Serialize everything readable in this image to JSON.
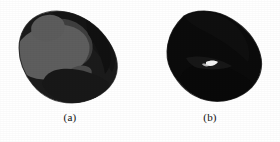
{
  "figure": {
    "background_color": "#ffffff",
    "panels": [
      {
        "id": "a",
        "caption": "(a)",
        "description": "segmented blob render with distinct gray shaded regions",
        "colors": {
          "body_dark": "#1b1b1b",
          "mid_gray": "#3e3e3e",
          "light_gray": "#5e5e5e",
          "highlight_gray": "#4a4a4a",
          "outline": "#151515"
        },
        "regions": [
          {
            "name": "large-light-ellipse",
            "color": "#5e5e5e"
          },
          {
            "name": "upper-mid-lobe",
            "color": "#3e3e3e"
          },
          {
            "name": "lower-small-lobe",
            "color": "#4a4a4a"
          },
          {
            "name": "dark-body",
            "color": "#1b1b1b"
          },
          {
            "name": "dark-upper-band",
            "color": "#171717"
          }
        ]
      },
      {
        "id": "b",
        "caption": "(b)",
        "description": "uniform dark silhouette render of the same blob",
        "colors": {
          "body_dark": "#0b0b0b",
          "body_shadow": "#131313",
          "specular_sliver": "#f2f2f2",
          "outline": "#050505"
        },
        "regions": [
          {
            "name": "upper-lobe",
            "color": "#0d0d0d"
          },
          {
            "name": "lower-lobe",
            "color": "#0a0a0a"
          },
          {
            "name": "crease",
            "color": "#1a1a1a"
          },
          {
            "name": "specular-highlight",
            "color": "#f2f2f2"
          }
        ]
      }
    ]
  }
}
